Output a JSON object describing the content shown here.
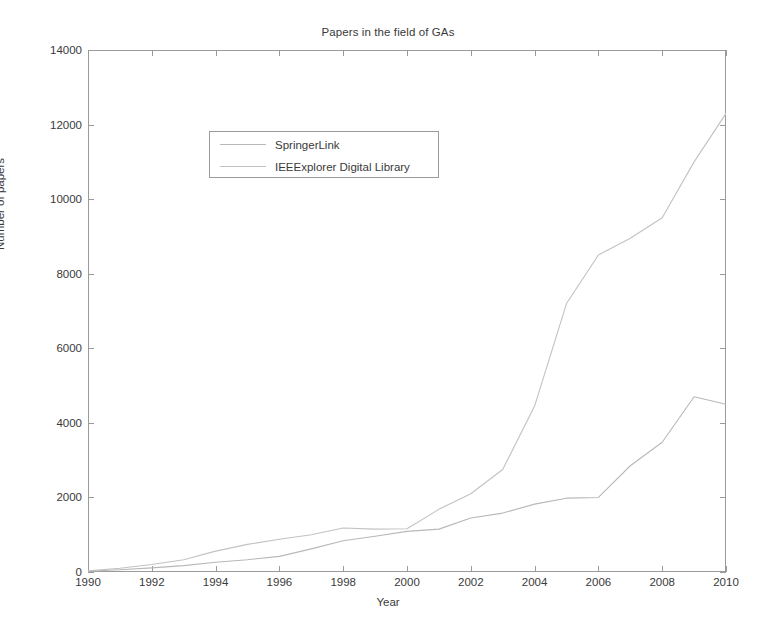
{
  "chart_data": {
    "type": "line",
    "title": "Papers in the field of GAs",
    "xlabel": "Year",
    "ylabel": "Number of papers",
    "xlim": [
      1990,
      2010
    ],
    "ylim": [
      0,
      14000
    ],
    "grid": false,
    "legend_position": "upper-left-inside",
    "xticks": [
      1990,
      1992,
      1994,
      1996,
      1998,
      2000,
      2002,
      2004,
      2006,
      2008,
      2010
    ],
    "yticks": [
      0,
      2000,
      4000,
      6000,
      8000,
      10000,
      12000,
      14000
    ],
    "xtick_labels": [
      "1990",
      "1992",
      "1994",
      "1996",
      "1998",
      "2000",
      "2002",
      "2004",
      "2006",
      "2008",
      "2010"
    ],
    "ytick_labels": [
      "0",
      "2000",
      "4000",
      "6000",
      "8000",
      "10000",
      "12000",
      "14000"
    ],
    "x": [
      1990,
      1991,
      1992,
      1993,
      1994,
      1995,
      1996,
      1997,
      1998,
      1999,
      2000,
      2001,
      2002,
      2003,
      2004,
      2005,
      2006,
      2007,
      2008,
      2009,
      2010
    ],
    "series": [
      {
        "name": "SpringerLink",
        "color": "#b8b8b8",
        "values": [
          20,
          60,
          110,
          170,
          260,
          330,
          420,
          620,
          840,
          960,
          1090,
          1150,
          1450,
          1580,
          1820,
          1980,
          2000,
          2850,
          3480,
          4700,
          4500
        ]
      },
      {
        "name": "IEEExplorer Digital Library",
        "color": "#c2c2c2",
        "values": [
          30,
          100,
          200,
          330,
          560,
          740,
          880,
          1000,
          1180,
          1150,
          1160,
          1680,
          2100,
          2750,
          4450,
          7200,
          8500,
          8950,
          9500,
          11000,
          12300
        ]
      }
    ]
  },
  "legend": {
    "items": [
      {
        "label": "SpringerLink"
      },
      {
        "label": "IEEExplorer Digital Library"
      }
    ]
  }
}
